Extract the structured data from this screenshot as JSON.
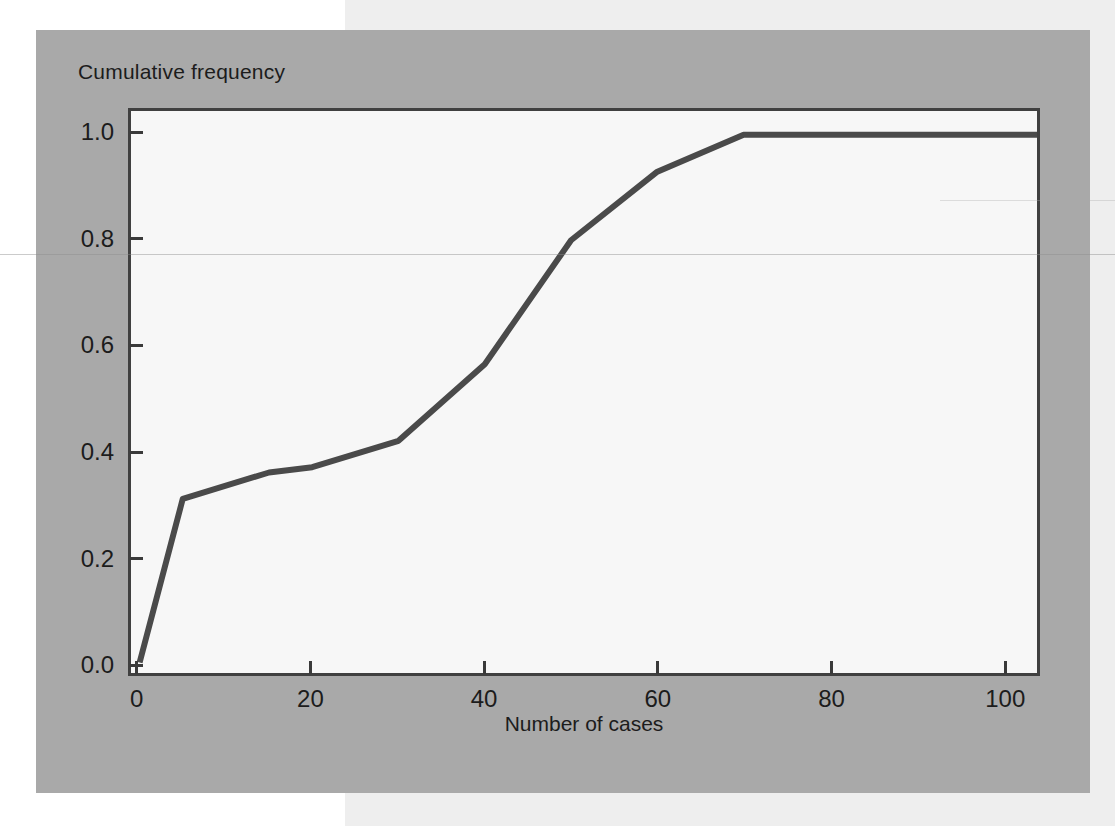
{
  "figure": {
    "background_color": "#a9a9a9",
    "page_band_color": "#eeeeee",
    "plot_background_color": "#f7f7f7",
    "line_color": "#4a4a4a",
    "axis_color": "#404040"
  },
  "chart_data": {
    "type": "line",
    "title": "",
    "subtitle": "",
    "xlabel": "Number of cases",
    "ylabel": "Cumulative frequency",
    "xlim": [
      -1,
      104
    ],
    "ylim": [
      -0.02,
      1.045
    ],
    "xticks": [
      0,
      20,
      40,
      60,
      80,
      100
    ],
    "xtick_labels": [
      "0",
      "20",
      "40",
      "60",
      "80",
      "100"
    ],
    "yticks": [
      0.0,
      0.2,
      0.4,
      0.6,
      0.8,
      1.0
    ],
    "ytick_labels": [
      "0.0",
      "0.2",
      "0.4",
      "0.6",
      "0.8",
      "1.0"
    ],
    "grid": false,
    "legend": null,
    "legend_position": "none",
    "series": [
      {
        "name": "Cumulative frequency",
        "x": [
          0,
          5,
          15,
          20,
          30,
          40,
          50,
          60,
          70,
          104
        ],
        "values": [
          0.0,
          0.31,
          0.36,
          0.37,
          0.42,
          0.565,
          0.8,
          0.93,
          1.0,
          1.0
        ]
      }
    ]
  }
}
